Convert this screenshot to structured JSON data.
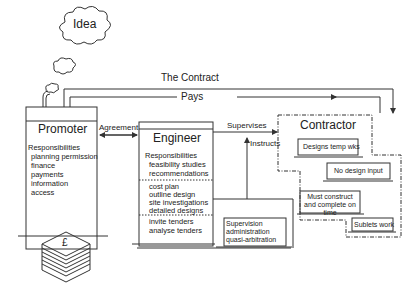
{
  "diagram": {
    "idea_label": "Idea",
    "contract_label": "The Contract",
    "pays_label": "Pays",
    "agreement_label": "Agreement",
    "supervises_label": "Supervises",
    "instructs_label": "Instructs",
    "promoter": {
      "title": "Promoter",
      "responsibilities_heading": "Responsibilities",
      "responsibilities": [
        "planning permission",
        "finance",
        "payments",
        "information",
        "access"
      ],
      "money_icon_symbol": "£"
    },
    "engineer": {
      "title": "Engineer",
      "responsibilities_heading": "Responsibilities",
      "group1": [
        "feasibility studies",
        "recommendations"
      ],
      "group2": [
        "cost plan",
        "outline design",
        "site investigations",
        "detailed designs"
      ],
      "group3": [
        "invite tenders",
        "analyse tenders"
      ],
      "supervision_box": [
        "Supervision",
        "administration",
        "quasi-arbitration"
      ]
    },
    "contractor": {
      "title": "Contractor",
      "items": [
        "Designs temp wks",
        "No design input",
        "Must construct and complete on time",
        "Sublets work"
      ]
    },
    "colors": {
      "line": "#333333",
      "background": "#ffffff"
    }
  }
}
